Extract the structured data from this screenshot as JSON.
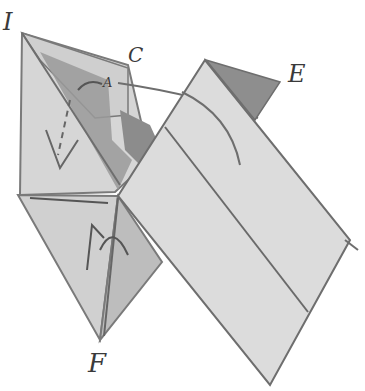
{
  "figure": {
    "labels": {
      "I": "I",
      "C": "C",
      "A": "A",
      "E": "E",
      "F": "F"
    },
    "colors": {
      "paper_light": "#d9d9d9",
      "paper_mid": "#c8c8c8",
      "paper_dark": "#8f8f8f",
      "outline": "#6b6b6b",
      "background": "#ffffff"
    }
  }
}
